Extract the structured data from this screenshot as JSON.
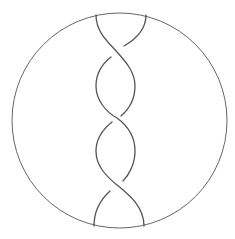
{
  "diagram": {
    "type": "braid / tangle diagram",
    "boundary": {
      "shape": "circle",
      "cx": 119.5,
      "cy": 120.5,
      "r": 107.5
    },
    "strand_count": 2,
    "crossing_count": 3,
    "crossings": [
      {
        "index": 1,
        "x": 117,
        "y": 52,
        "over": "top-left strand (\\)"
      },
      {
        "index": 2,
        "x": 117,
        "y": 118,
        "over": "upper-right strand (/)"
      },
      {
        "index": 3,
        "x": 117,
        "y": 185,
        "over": "upper-left strand (\\)"
      }
    ],
    "endpoints": {
      "top": [
        {
          "x": 96,
          "y": 15
        },
        {
          "x": 146,
          "y": 15
        }
      ],
      "bottom": [
        {
          "x": 94,
          "y": 226
        },
        {
          "x": 144,
          "y": 226
        }
      ]
    },
    "colors": {
      "stroke": "#555555",
      "background": "#ffffff"
    }
  }
}
